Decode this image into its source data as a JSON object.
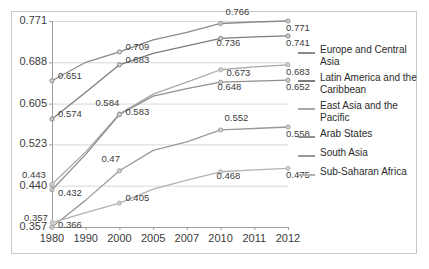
{
  "chart_data": {
    "type": "line",
    "title": "",
    "xlabel": "",
    "ylabel": "",
    "grid": true,
    "legend_position": "right",
    "categories": [
      "1980",
      "1990",
      "2000",
      "2005",
      "2007",
      "2010",
      "2011",
      "2012"
    ],
    "x": [
      1980,
      1990,
      2000,
      2005,
      2007,
      2010,
      2011,
      2012
    ],
    "ylim": [
      0.357,
      0.771
    ],
    "yticks": [
      "0.357",
      "0.440",
      "0.523",
      "0.605",
      "0.688",
      "0.771"
    ],
    "ytick_values": [
      0.357,
      0.44,
      0.523,
      0.605,
      0.688,
      0.771
    ],
    "series": [
      {
        "name": "Europe and Central Asia",
        "color": "#8a8a8a",
        "values": [
          0.651,
          0.688,
          0.709,
          0.733,
          0.748,
          0.766,
          0.769,
          0.771
        ],
        "labels": [
          "0.651",
          "",
          "0.709",
          "",
          "",
          "0.766",
          "",
          "0.771"
        ]
      },
      {
        "name": "Latin America and the Caribbean",
        "color": "#7d7d7d",
        "values": [
          0.574,
          0.628,
          0.683,
          0.706,
          0.721,
          0.736,
          0.739,
          0.741
        ],
        "labels": [
          "0.574",
          "",
          "0.683",
          "",
          "",
          "0.736",
          "",
          "0.741"
        ]
      },
      {
        "name": "East Asia and the Pacific",
        "color": "#a8a8a8",
        "values": [
          0.443,
          0.508,
          0.584,
          0.624,
          0.648,
          0.673,
          0.679,
          0.683
        ],
        "labels": [
          "0.443",
          "",
          "0.584",
          "",
          "",
          "0.673",
          "",
          "0.683"
        ]
      },
      {
        "name": "Arab States",
        "color": "#8f8f8f",
        "values": [
          0.432,
          0.503,
          0.583,
          0.62,
          0.635,
          0.648,
          0.65,
          0.652
        ],
        "labels": [
          "0.432",
          "",
          "0.583",
          "",
          "",
          "0.648",
          "",
          "0.652"
        ]
      },
      {
        "name": "South Asia",
        "color": "#9a9a9a",
        "values": [
          0.357,
          0.411,
          0.47,
          0.511,
          0.528,
          0.552,
          0.555,
          0.558
        ],
        "labels": [
          "0.357",
          "",
          "0.47",
          "",
          "",
          "0.552",
          "",
          "0.558"
        ]
      },
      {
        "name": "Sub-Saharan Africa",
        "color": "#b2b2b2",
        "values": [
          0.366,
          0.386,
          0.405,
          0.433,
          0.451,
          0.468,
          0.472,
          0.475
        ],
        "labels": [
          "0.366",
          "",
          "0.405",
          "",
          "",
          "0.468",
          "",
          "0.475"
        ]
      }
    ]
  },
  "legend": {
    "items": [
      {
        "label": "Europe and Central Asia",
        "color": "#8a8a8a"
      },
      {
        "label": "Latin America and the Caribbean",
        "color": "#7d7d7d"
      },
      {
        "label": "East Asia and the Pacific",
        "color": "#a8a8a8"
      },
      {
        "label": "Arab States",
        "color": "#8f8f8f"
      },
      {
        "label": "South Asia",
        "color": "#9a9a9a"
      },
      {
        "label": "Sub-Saharan Africa",
        "color": "#b2b2b2"
      }
    ]
  },
  "axes": {
    "x_ticks": [
      "1980",
      "1990",
      "2000",
      "2005",
      "2007",
      "2010",
      "2011",
      "2012"
    ],
    "y_ticks": [
      "0.771",
      "0.688",
      "0.605",
      "0.523",
      "0.440",
      "0.357"
    ]
  },
  "colors": {
    "frame": "#c9c9c9",
    "gridline": "#d8d8d8",
    "axis": "#9e9e9e",
    "text": "#3b3b3b"
  }
}
